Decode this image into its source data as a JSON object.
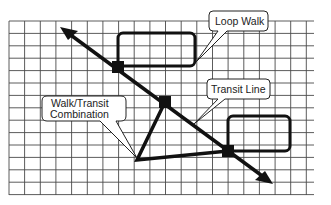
{
  "diagram": {
    "colors": {
      "background": "#ffffff",
      "grid": "#444444",
      "line": "#111111",
      "callout_fill": "#ffffff",
      "callout_stroke": "#222222",
      "text": "#222222"
    },
    "grid": {
      "x0": 9,
      "y0": 21,
      "x1": 314,
      "y1": 195,
      "cols": 19.5,
      "dx": 15.65,
      "dy": 12.4
    },
    "labels": {
      "loop_walk": "Loop Walk",
      "transit_line": "Transit Line",
      "walk_transit_line1": "Walk/Transit",
      "walk_transit_line2": "Combination"
    },
    "nodes": [
      {
        "id": "stop-upper",
        "x": 118,
        "y": 67
      },
      {
        "id": "stop-middle",
        "x": 165,
        "y": 102
      },
      {
        "id": "stop-lower",
        "x": 228,
        "y": 151
      }
    ],
    "elements": [
      "transit-line-arrow",
      "loop-walk-upper",
      "loop-walk-lower",
      "walk-transit-triangle"
    ]
  }
}
